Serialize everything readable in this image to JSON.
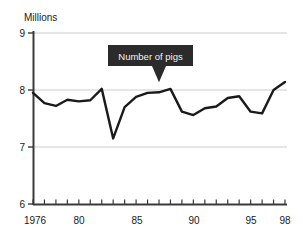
{
  "chart_data": {
    "type": "line",
    "title": "",
    "ylabel": "Millions",
    "xlabel": "",
    "ylim": [
      6,
      9
    ],
    "xlim": [
      1976,
      1998
    ],
    "grid": true,
    "gridlines_y": [
      7,
      8,
      9
    ],
    "y_ticks": [
      6,
      7,
      8,
      9
    ],
    "y_tick_labels": [
      "6",
      "7",
      "8",
      "9"
    ],
    "x_ticks": [
      1976,
      1977,
      1978,
      1979,
      1980,
      1981,
      1982,
      1983,
      1984,
      1985,
      1986,
      1987,
      1988,
      1989,
      1990,
      1991,
      1992,
      1993,
      1994,
      1995,
      1996,
      1997,
      1998
    ],
    "x_tick_labels_shown": [
      {
        "value": 1976,
        "label": "1976"
      },
      {
        "value": 1980,
        "label": "80"
      },
      {
        "value": 1985,
        "label": "85"
      },
      {
        "value": 1990,
        "label": "90"
      },
      {
        "value": 1995,
        "label": "95"
      },
      {
        "value": 1998,
        "label": "98"
      }
    ],
    "legend_position": "none",
    "series": [
      {
        "name": "Number of pigs",
        "color": "#1a1a1a",
        "x": [
          1976,
          1977,
          1978,
          1979,
          1980,
          1981,
          1982,
          1983,
          1984,
          1985,
          1986,
          1987,
          1988,
          1989,
          1990,
          1991,
          1992,
          1993,
          1994,
          1995,
          1996,
          1997,
          1998
        ],
        "values": [
          7.95,
          7.77,
          7.72,
          7.83,
          7.8,
          7.82,
          8.02,
          7.15,
          7.7,
          7.88,
          7.95,
          7.96,
          8.02,
          7.62,
          7.56,
          7.68,
          7.71,
          7.86,
          7.89,
          7.62,
          7.59,
          8.0,
          8.14
        ]
      }
    ],
    "annotations": [
      {
        "type": "callout",
        "text": "Number of pigs",
        "box_color": "#2b2b2b",
        "text_color": "#f2f2f2",
        "points_at_x": 1987,
        "points_at_y": 7.96
      }
    ]
  },
  "axis": {
    "y_axis_title": "Millions",
    "y_tick_9": "9",
    "y_tick_8": "8",
    "y_tick_7": "7",
    "y_tick_6": "6",
    "x_tick_1976": "1976",
    "x_tick_80": "80",
    "x_tick_85": "85",
    "x_tick_90": "90",
    "x_tick_95": "95",
    "x_tick_98": "98"
  },
  "callout": {
    "label": "Number of pigs"
  },
  "colors": {
    "line": "#1a1a1a",
    "axis": "#3a3a3a",
    "gridline": "#cccccc",
    "callout_bg": "#2b2b2b",
    "callout_fg": "#f2f2f2",
    "background": "#ffffff"
  }
}
